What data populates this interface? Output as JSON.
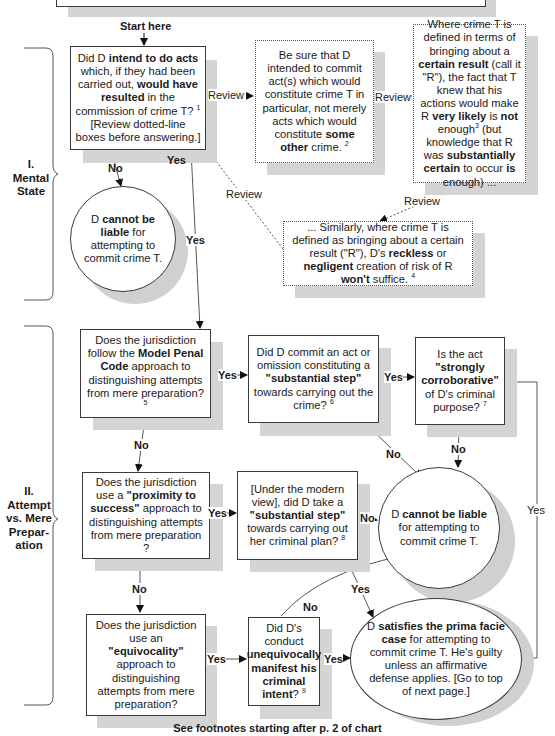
{
  "start_label": "Start here",
  "sections": [
    {
      "id": "I",
      "lines": [
        "I.",
        "Mental",
        "State"
      ]
    },
    {
      "id": "II",
      "lines": [
        "II.",
        "Attempt",
        "vs. Mere",
        "Prepar-",
        "ation"
      ]
    }
  ],
  "nodes": {
    "intend": {
      "html": "Did D <b>intend to do acts</b> which, if they had been carried out, <b>would have resulted</b> in the commission of crime T? <sup>1</sup> [Review dotted-line boxes before answering.]"
    },
    "be_sure": {
      "html": "Be sure that D intended to commit act(s) which would constitute crime T in particular, not merely acts which would constitute <b>some other</b> crime. <sup>2</sup>"
    },
    "certain_result": {
      "html": "Where crime T is defined in terms of bringing about a <b>certain result</b> (call it \"R\"), the fact that T knew that his actions would make R <b>very likely</b> is <b>not</b> enough<sup>3</sup> (but knowledge that R was <b>substantially certain</b> to occur <b>is</b> enough) ..."
    },
    "similarly": {
      "html": "... Similarly, where crime T is defined as bringing about a certain result (\"R\"), D's <b>reckless</b> or <b>negligent</b> creation of risk of R <b>won't</b> suffice. <sup>4</sup>"
    },
    "not_liable_1": {
      "html": "D <b>cannot be liable</b> for attempting to commit crime T."
    },
    "mpc": {
      "html": "Does the jurisdiction follow the <b>Model Penal Code</b> approach to distinguishing attempts from mere preparation? <sup>5</sup>"
    },
    "substantial_step": {
      "html": "Did D commit an act or omission constituting a <b>\"substantial step\"</b> towards carrying out the crime? <sup>6</sup>"
    },
    "corroborative": {
      "html": "Is the act <b>\"strongly corroborative\"</b> of D's criminal purpose? <sup>7</sup>"
    },
    "proximity": {
      "html": "Does the jurisdiction use a <b>\"proximity to success\"</b> approach to distinguishing attempts from mere preparation ?"
    },
    "modern_view": {
      "html": "[Under the modern view], did D take a <b>\"substantial step\"</b> towards carrying out her criminal plan? <sup>8</sup>"
    },
    "not_liable_2": {
      "html": "D <b>cannot be liable</b> for attempting to commit crime T."
    },
    "equivocality": {
      "html": "Does the jurisdiction use an <b>\"equivocality\"</b> approach to distinguishing attempts from mere preparation?"
    },
    "unequivocal": {
      "html": "Did D's conduct <b>unequivocally manifest his criminal intent</b>? <sup>9</sup>"
    },
    "prima_facie": {
      "html": "D <b>satisfies the prima facie case</b> for attempting to commit crime T. He's guilty unless an affirmative defense applies. [Go to top of next page.]"
    }
  },
  "edge_labels": {
    "yes": "Yes",
    "no": "No",
    "review": "Review"
  },
  "footer": "See footnotes starting after p. 2 of chart"
}
